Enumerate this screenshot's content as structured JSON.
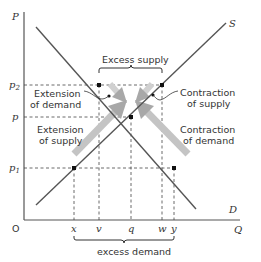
{
  "axes": {
    "y_label": "P",
    "x_label": "Q",
    "origin": "O",
    "y_ticks": [
      {
        "label": "p",
        "sub": "2",
        "y": 85
      },
      {
        "label": "p",
        "sub": "",
        "y": 117
      },
      {
        "label": "p",
        "sub": "1",
        "y": 168
      }
    ],
    "x_ticks": [
      {
        "label": "x",
        "x": 74
      },
      {
        "label": "v",
        "x": 99
      },
      {
        "label": "q",
        "x": 131
      },
      {
        "label": "w",
        "x": 162
      },
      {
        "label": "y",
        "x": 174
      }
    ]
  },
  "curves": {
    "supply_label": "S",
    "demand_label": "D"
  },
  "annotations": {
    "excess_supply": "Excess supply",
    "excess_demand": "excess demand",
    "extension_of_demand": [
      "Extension",
      "of demand"
    ],
    "extension_of_supply": [
      "Extension",
      "of supply"
    ],
    "contraction_of_supply": [
      "Contraction",
      "of supply"
    ],
    "contraction_of_demand": [
      "Contraction",
      "of demand"
    ]
  },
  "colors": {
    "line": "#555555",
    "arrow": "#b0b0b0",
    "point": "#111111"
  }
}
